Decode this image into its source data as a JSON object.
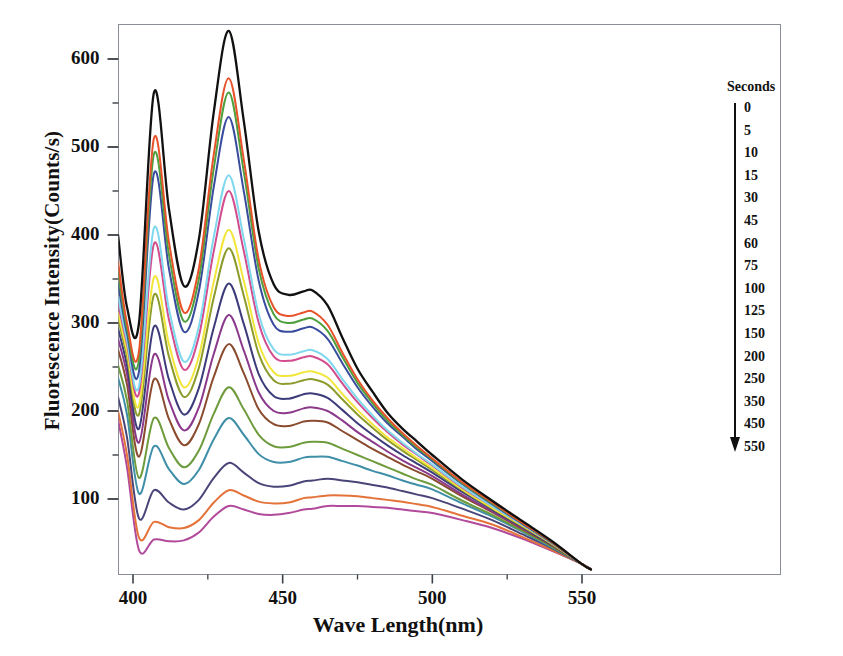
{
  "chart_data": {
    "type": "line",
    "title": "",
    "xlabel": "Wave Length(nm)",
    "ylabel": "Fluorescence Intensity(Counts/s)",
    "xlim": [
      393,
      558
    ],
    "ylim": [
      8,
      660
    ],
    "xticks": [
      400,
      450,
      500,
      550
    ],
    "xticks_minor": [
      425,
      475,
      525
    ],
    "yticks": [
      100,
      200,
      300,
      400,
      500,
      600
    ],
    "yticks_minor": [
      150,
      250,
      350,
      450,
      550
    ],
    "grid": false,
    "legend_title": "Seconds",
    "legend_position": "right-outside",
    "legend_arrow": "down",
    "x": [
      395,
      398,
      402,
      407,
      412,
      417,
      422,
      427,
      432,
      437,
      442,
      447,
      452,
      457,
      460,
      465,
      470,
      475,
      480,
      485,
      490,
      495,
      500,
      510,
      520,
      530,
      540,
      550,
      553
    ],
    "series": [
      {
        "name": "0",
        "color": "#111111",
        "values": [
          400,
          318,
          300,
          562,
          430,
          342,
          395,
          540,
          632,
          530,
          404,
          344,
          332,
          336,
          337,
          320,
          283,
          248,
          222,
          198,
          180,
          165,
          150,
          122,
          98,
          75,
          52,
          26,
          20
        ]
      },
      {
        "name": "5",
        "color": "#E8522A",
        "values": [
          370,
          300,
          268,
          510,
          392,
          312,
          362,
          492,
          578,
          486,
          372,
          318,
          308,
          312,
          313,
          298,
          266,
          236,
          212,
          192,
          175,
          160,
          146,
          119,
          96,
          73,
          51,
          26,
          20
        ]
      },
      {
        "name": "10",
        "color": "#4E9F3D",
        "values": [
          358,
          294,
          258,
          492,
          378,
          302,
          350,
          476,
          562,
          472,
          362,
          310,
          300,
          304,
          305,
          291,
          261,
          232,
          209,
          189,
          173,
          158,
          145,
          118,
          95,
          73,
          51,
          26,
          20
        ]
      },
      {
        "name": "15",
        "color": "#3A4C9E",
        "values": [
          345,
          288,
          245,
          470,
          362,
          290,
          336,
          455,
          534,
          450,
          348,
          298,
          290,
          294,
          295,
          282,
          254,
          227,
          205,
          186,
          171,
          156,
          143,
          117,
          94,
          72,
          50,
          26,
          20
        ]
      },
      {
        "name": "30",
        "color": "#7FD8EE",
        "values": [
          330,
          280,
          228,
          408,
          316,
          256,
          296,
          398,
          468,
          396,
          310,
          270,
          264,
          268,
          269,
          259,
          236,
          214,
          195,
          178,
          164,
          151,
          139,
          114,
          92,
          71,
          50,
          26,
          20
        ]
      },
      {
        "name": "45",
        "color": "#D24C8E",
        "values": [
          322,
          276,
          220,
          390,
          304,
          247,
          285,
          382,
          450,
          382,
          300,
          262,
          257,
          261,
          262,
          253,
          231,
          210,
          192,
          176,
          162,
          150,
          138,
          113,
          92,
          71,
          50,
          26,
          20
        ]
      },
      {
        "name": "60",
        "color": "#F2E63C",
        "values": [
          312,
          268,
          206,
          352,
          276,
          227,
          262,
          347,
          406,
          348,
          277,
          244,
          240,
          244,
          245,
          238,
          219,
          201,
          185,
          170,
          158,
          146,
          135,
          111,
          90,
          70,
          49,
          26,
          20
        ]
      },
      {
        "name": "75",
        "color": "#8C9B2B",
        "values": [
          305,
          262,
          196,
          332,
          262,
          216,
          249,
          329,
          385,
          331,
          265,
          235,
          231,
          235,
          236,
          230,
          213,
          196,
          181,
          167,
          155,
          144,
          133,
          110,
          89,
          69,
          49,
          26,
          20
        ]
      },
      {
        "name": "100",
        "color": "#3D3C7A",
        "values": [
          294,
          252,
          180,
          296,
          236,
          196,
          226,
          295,
          345,
          299,
          242,
          217,
          214,
          219,
          220,
          215,
          201,
          186,
          173,
          161,
          150,
          140,
          130,
          108,
          88,
          68,
          48,
          26,
          20
        ]
      },
      {
        "name": "125",
        "color": "#8B3A8B",
        "values": [
          282,
          242,
          164,
          264,
          212,
          178,
          204,
          265,
          309,
          269,
          221,
          200,
          198,
          203,
          204,
          200,
          189,
          176,
          165,
          154,
          144,
          135,
          126,
          105,
          86,
          67,
          48,
          26,
          20
        ]
      },
      {
        "name": "150",
        "color": "#8A4B2E",
        "values": [
          270,
          230,
          148,
          236,
          191,
          161,
          185,
          239,
          276,
          243,
          202,
          185,
          183,
          188,
          189,
          187,
          177,
          167,
          157,
          148,
          139,
          131,
          123,
          103,
          85,
          66,
          47,
          26,
          20
        ]
      },
      {
        "name": "200",
        "color": "#6E9B3C",
        "values": [
          252,
          212,
          124,
          192,
          158,
          136,
          155,
          197,
          227,
          202,
          173,
          160,
          159,
          164,
          165,
          164,
          157,
          150,
          143,
          136,
          129,
          122,
          116,
          98,
          82,
          64,
          46,
          26,
          20
        ]
      },
      {
        "name": "250",
        "color": "#3F8FA8",
        "values": [
          238,
          196,
          106,
          160,
          134,
          117,
          133,
          168,
          192,
          173,
          151,
          142,
          142,
          147,
          148,
          148,
          143,
          138,
          132,
          127,
          121,
          116,
          111,
          95,
          80,
          63,
          45,
          26,
          20
        ]
      },
      {
        "name": "350",
        "color": "#4A4578",
        "values": [
          216,
          170,
          78,
          110,
          96,
          88,
          99,
          124,
          141,
          130,
          118,
          114,
          115,
          120,
          121,
          123,
          121,
          119,
          116,
          113,
          109,
          105,
          101,
          89,
          76,
          60,
          44,
          26,
          20
        ]
      },
      {
        "name": "450",
        "color": "#E4733A",
        "values": [
          200,
          150,
          56,
          74,
          68,
          67,
          76,
          96,
          110,
          104,
          97,
          95,
          96,
          101,
          102,
          104,
          104,
          103,
          101,
          99,
          97,
          94,
          91,
          81,
          71,
          57,
          42,
          26,
          20
        ]
      },
      {
        "name": "550",
        "color": "#B24A9B",
        "values": [
          190,
          136,
          42,
          54,
          52,
          53,
          62,
          80,
          92,
          88,
          83,
          82,
          84,
          88,
          89,
          92,
          92,
          92,
          91,
          90,
          88,
          86,
          84,
          76,
          67,
          55,
          41,
          26,
          20
        ]
      }
    ]
  },
  "axes": {
    "ytick_labels": [
      "600",
      "500",
      "400",
      "300",
      "200",
      "100"
    ],
    "xtick_labels": [
      "400",
      "450",
      "500",
      "550"
    ],
    "ylabel_text": "Fluorescence Intensity(Counts/s)",
    "xlabel_text": "Wave Length(nm)"
  },
  "legend": {
    "title": "Seconds",
    "items": [
      "0",
      "5",
      "10",
      "15",
      "30",
      "45",
      "60",
      "75",
      "100",
      "125",
      "150",
      "200",
      "250",
      "350",
      "450",
      "550"
    ]
  }
}
